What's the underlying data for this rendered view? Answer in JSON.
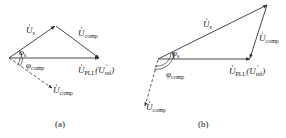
{
  "diagram": {
    "panels": [
      {
        "id": "a",
        "caption": "(a)",
        "labels": {
          "us": "U",
          "us_sub": "s",
          "ucomp_top": "U",
          "ucomp_top_sub": "comp",
          "phi_s": "φ",
          "phi_s_sub": "s",
          "phi_comp": "φ",
          "phi_comp_sub": "comp",
          "upll": "U",
          "upll_sub": "PLL",
          "uref_open": "(U",
          "uref_sub": "ref",
          "uref_close": ")",
          "ucomp_dash": "U",
          "ucomp_dash_sub": "comp"
        }
      },
      {
        "id": "b",
        "caption": "(b)",
        "labels": {
          "us": "U",
          "us_sub": "s",
          "ucomp_top": "U",
          "ucomp_top_sub": "comp",
          "phi_s": "φ",
          "phi_s_sub": "s",
          "phi_comp": "φ",
          "phi_comp_sub": "comp",
          "upll": "U",
          "upll_sub": "PLL",
          "uref_open": "(U",
          "uref_sub": "ref",
          "uref_close": ")",
          "ucomp_dash": "U",
          "ucomp_dash_sub": "comp"
        }
      }
    ],
    "colors": {
      "line": "#333333",
      "text": "#222222"
    }
  }
}
